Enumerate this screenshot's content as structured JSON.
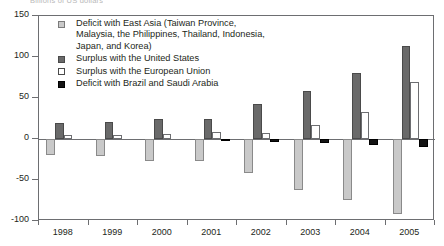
{
  "subtitle": "Billions of US dollars",
  "chart_data": {
    "type": "bar",
    "title": "",
    "subtitle": "Billions of US dollars",
    "xlabel": "",
    "ylabel": "",
    "categories": [
      "1998",
      "1999",
      "2000",
      "2001",
      "2002",
      "2003",
      "2004",
      "2005"
    ],
    "ylim": [
      -100,
      150
    ],
    "yticks": [
      150,
      100,
      50,
      0,
      -50,
      -100
    ],
    "ytick_labels": [
      "150",
      "100",
      "50",
      "0",
      "-50",
      "-100"
    ],
    "grid": false,
    "legend_position": "inside-top-left",
    "series": [
      {
        "name": "Deficit with East Asia (Taiwan Province, Malaysia, the Philippines, Thailand, Indonesia, Japan, and Korea)",
        "color": "#c9c9c9",
        "values": [
          -19,
          -21,
          -27,
          -27,
          -42,
          -62,
          -74,
          -92
        ]
      },
      {
        "name": "Surplus with the United States",
        "color": "#6a6a6a",
        "values": [
          19,
          21,
          25,
          25,
          43,
          58,
          80,
          113
        ]
      },
      {
        "name": "Surplus with the European Union",
        "color": "#ffffff",
        "values": [
          5,
          5,
          6,
          8,
          7,
          17,
          33,
          70
        ]
      },
      {
        "name": "Deficit with Brazil and Saudi Arabia",
        "color": "#141414",
        "values": [
          0,
          0,
          0,
          -3,
          -4,
          -5,
          -7,
          -10
        ]
      }
    ]
  },
  "legend": [
    {
      "swatch": "s0",
      "lines": [
        "Deficit with East Asia (Taiwan Province,",
        "Malaysia, the Philippines, Thailand, Indonesia,",
        "Japan, and Korea)"
      ]
    },
    {
      "swatch": "s1",
      "lines": [
        "Surplus with the United States"
      ]
    },
    {
      "swatch": "s2",
      "lines": [
        "Surplus with the European Union"
      ]
    },
    {
      "swatch": "s3",
      "lines": [
        "Deficit with Brazil and Saudi Arabia"
      ]
    }
  ]
}
